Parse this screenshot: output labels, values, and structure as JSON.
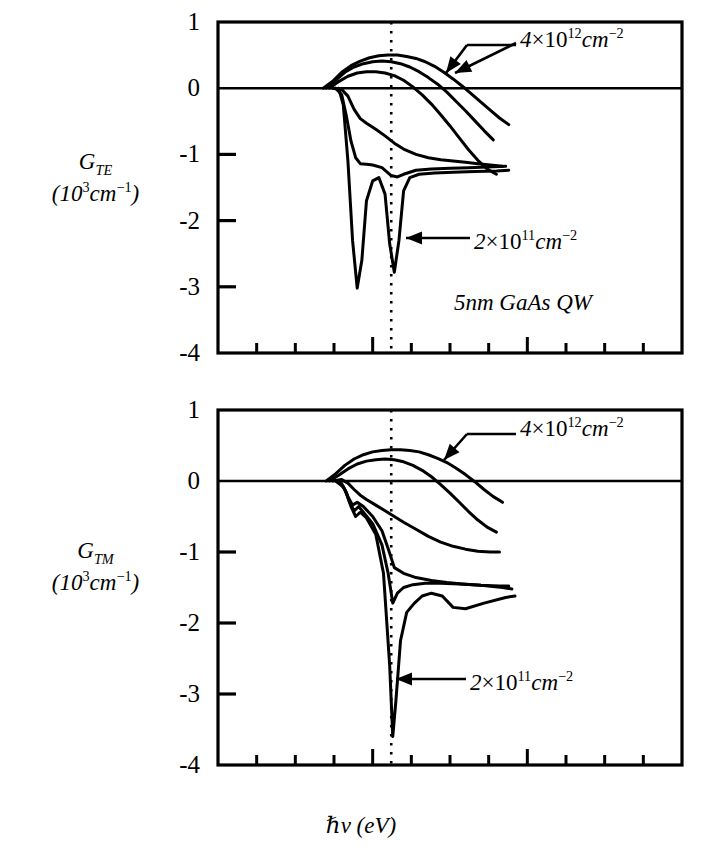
{
  "figure": {
    "xlabel_hbar": "ℏ",
    "xlabel_nu": "ν",
    "xlabel_unit": "(eV)",
    "material_note": "5nm GaAs QW"
  },
  "panels": [
    {
      "id": "TE",
      "ylabel_main": "G",
      "ylabel_sub": "TE",
      "ylabel_units_pre": "(10",
      "ylabel_units_exp": "3",
      "ylabel_units_mid": "cm",
      "ylabel_units_exp2": "−1",
      "ylabel_units_post": ")",
      "yticks": [
        "1",
        "0",
        "-1",
        "-2",
        "-3",
        "-4"
      ],
      "annotation_high": {
        "coef": "4",
        "times": "×",
        "base": "10",
        "exp": "12",
        "unit": "cm",
        "unit_exp": "−2"
      },
      "annotation_low": {
        "coef": "2",
        "times": "×",
        "base": "10",
        "exp": "11",
        "unit": "cm",
        "unit_exp": "−2"
      }
    },
    {
      "id": "TM",
      "ylabel_main": "G",
      "ylabel_sub": "TM",
      "ylabel_units_pre": "(10",
      "ylabel_units_exp": "3",
      "ylabel_units_mid": "cm",
      "ylabel_units_exp2": "−1",
      "ylabel_units_post": ")",
      "yticks": [
        "1",
        "0",
        "-1",
        "-2",
        "-3",
        "-4"
      ],
      "annotation_high": {
        "coef": "4",
        "times": "×",
        "base": "10",
        "exp": "12",
        "unit": "cm",
        "unit_exp": "−2"
      },
      "annotation_low": {
        "coef": "2",
        "times": "×",
        "base": "10",
        "exp": "11",
        "unit": "cm",
        "unit_exp": "−2"
      }
    }
  ],
  "xticks": [
    "1.4",
    "1.5",
    "1.6",
    "1.7"
  ],
  "chart_data": [
    {
      "type": "line",
      "title": "G_TE (10^3 cm^-1) vs photon energy",
      "xlabel": "hbar*nu (eV)",
      "ylabel": "G_TE (10^3 cm^-1)",
      "xlim": [
        1.4,
        1.7
      ],
      "ylim": [
        -4,
        1
      ],
      "xticks": [
        1.4,
        1.5,
        1.6,
        1.7
      ],
      "yticks": [
        1,
        0,
        -1,
        -2,
        -3,
        -4
      ],
      "grid": false,
      "legend": "none",
      "vertical_marker": {
        "x": 1.512,
        "style": "dotted"
      },
      "zero_line": true,
      "annotations": [
        {
          "text": "4×10^12 cm^-2",
          "points_to_curve": "n=4e12",
          "arrow": "down-left",
          "x": 1.575,
          "y": 0.62
        },
        {
          "text": "2×10^11 cm^-2",
          "points_to_curve": "n=2e11",
          "arrow": "left",
          "x": 1.555,
          "y": -2.05
        },
        {
          "text": "5nm GaAs QW",
          "x": 1.555,
          "y": -2.72
        }
      ],
      "series": [
        {
          "name": "n=4e12",
          "x": [
            1.468,
            1.474,
            1.48,
            1.486,
            1.492,
            1.498,
            1.504,
            1.51,
            1.516,
            1.522,
            1.528,
            1.534,
            1.54,
            1.546,
            1.552,
            1.558,
            1.564,
            1.57,
            1.576,
            1.582,
            1.588
          ],
          "values": [
            0.0,
            0.1,
            0.24,
            0.34,
            0.41,
            0.46,
            0.49,
            0.5,
            0.5,
            0.48,
            0.45,
            0.4,
            0.33,
            0.24,
            0.14,
            0.03,
            -0.09,
            -0.21,
            -0.33,
            -0.45,
            -0.55
          ]
        },
        {
          "name": "n=3e12",
          "x": [
            1.47,
            1.476,
            1.482,
            1.488,
            1.494,
            1.5,
            1.506,
            1.512,
            1.518,
            1.524,
            1.53,
            1.536,
            1.542,
            1.548,
            1.554,
            1.56,
            1.566,
            1.572,
            1.578
          ],
          "values": [
            0.0,
            0.12,
            0.24,
            0.32,
            0.37,
            0.4,
            0.41,
            0.4,
            0.37,
            0.32,
            0.25,
            0.16,
            0.06,
            -0.06,
            -0.2,
            -0.34,
            -0.49,
            -0.64,
            -0.78
          ]
        },
        {
          "name": "n=2e12",
          "x": [
            1.472,
            1.478,
            1.484,
            1.49,
            1.496,
            1.502,
            1.508,
            1.514,
            1.52,
            1.526,
            1.532,
            1.538,
            1.544,
            1.55,
            1.556,
            1.562,
            1.568,
            1.574,
            1.58
          ],
          "values": [
            0.0,
            0.1,
            0.18,
            0.23,
            0.25,
            0.25,
            0.23,
            0.19,
            0.12,
            0.02,
            -0.1,
            -0.24,
            -0.4,
            -0.57,
            -0.75,
            -0.93,
            -1.09,
            -1.22,
            -1.3
          ]
        },
        {
          "name": "n=1e12",
          "x": [
            1.474,
            1.48,
            1.484,
            1.488,
            1.492,
            1.496,
            1.502,
            1.508,
            1.514,
            1.52,
            1.528,
            1.536,
            1.544,
            1.552,
            1.56,
            1.568,
            1.576,
            1.584
          ],
          "values": [
            0.0,
            -0.02,
            -0.12,
            -0.32,
            -0.46,
            -0.53,
            -0.62,
            -0.72,
            -0.83,
            -0.92,
            -1.0,
            -1.05,
            -1.08,
            -1.1,
            -1.12,
            -1.14,
            -1.16,
            -1.18
          ]
        },
        {
          "name": "n=5e11",
          "x": [
            1.476,
            1.48,
            1.483,
            1.486,
            1.489,
            1.492,
            1.496,
            1.5,
            1.506,
            1.512,
            1.516,
            1.52,
            1.528,
            1.538,
            1.55,
            1.562,
            1.574,
            1.586
          ],
          "values": [
            0.0,
            -0.1,
            -0.42,
            -0.8,
            -1.05,
            -1.14,
            -1.15,
            -1.16,
            -1.2,
            -1.32,
            -1.34,
            -1.3,
            -1.24,
            -1.22,
            -1.21,
            -1.2,
            -1.19,
            -1.18
          ]
        },
        {
          "name": "n=2e11",
          "x": [
            1.478,
            1.481,
            1.484,
            1.487,
            1.49,
            1.493,
            1.496,
            1.5,
            1.504,
            1.508,
            1.511,
            1.514,
            1.517,
            1.52,
            1.524,
            1.53,
            1.54,
            1.552,
            1.566,
            1.58,
            1.588
          ],
          "values": [
            0.0,
            -0.25,
            -1.1,
            -2.3,
            -3.02,
            -2.6,
            -1.7,
            -1.4,
            -1.35,
            -1.6,
            -2.35,
            -2.78,
            -2.3,
            -1.55,
            -1.35,
            -1.3,
            -1.28,
            -1.27,
            -1.26,
            -1.25,
            -1.24
          ]
        }
      ]
    },
    {
      "type": "line",
      "title": "G_TM (10^3 cm^-1) vs photon energy",
      "xlabel": "hbar*nu (eV)",
      "ylabel": "G_TM (10^3 cm^-1)",
      "xlim": [
        1.4,
        1.7
      ],
      "ylim": [
        -4,
        1
      ],
      "xticks": [
        1.4,
        1.5,
        1.6,
        1.7
      ],
      "yticks": [
        1,
        0,
        -1,
        -2,
        -3,
        -4
      ],
      "grid": false,
      "legend": "none",
      "vertical_marker": {
        "x": 1.512,
        "style": "dotted"
      },
      "zero_line": true,
      "annotations": [
        {
          "text": "4×10^12 cm^-2",
          "points_to_curve": "n=4e12",
          "arrow": "down-left",
          "x": 1.575,
          "y": 0.62
        },
        {
          "text": "2×10^11 cm^-2",
          "points_to_curve": "n=2e11",
          "arrow": "left",
          "x": 1.548,
          "y": -2.8
        }
      ],
      "series": [
        {
          "name": "n=4e12",
          "x": [
            1.47,
            1.476,
            1.482,
            1.488,
            1.494,
            1.5,
            1.506,
            1.512,
            1.518,
            1.524,
            1.53,
            1.536,
            1.542,
            1.548,
            1.554,
            1.56,
            1.566,
            1.572,
            1.578,
            1.584
          ],
          "values": [
            0.0,
            0.1,
            0.22,
            0.31,
            0.37,
            0.41,
            0.43,
            0.44,
            0.44,
            0.43,
            0.41,
            0.37,
            0.32,
            0.26,
            0.18,
            0.09,
            -0.01,
            -0.12,
            -0.22,
            -0.3
          ]
        },
        {
          "name": "n=3e12",
          "x": [
            1.472,
            1.478,
            1.484,
            1.49,
            1.496,
            1.502,
            1.508,
            1.514,
            1.52,
            1.526,
            1.532,
            1.538,
            1.544,
            1.55,
            1.556,
            1.562,
            1.568,
            1.574,
            1.58
          ],
          "values": [
            0.0,
            0.08,
            0.17,
            0.24,
            0.28,
            0.3,
            0.31,
            0.3,
            0.27,
            0.22,
            0.15,
            0.06,
            -0.05,
            -0.17,
            -0.3,
            -0.43,
            -0.55,
            -0.65,
            -0.72
          ]
        },
        {
          "name": "n=2e12",
          "x": [
            1.474,
            1.48,
            1.484,
            1.488,
            1.492,
            1.496,
            1.502,
            1.508,
            1.514,
            1.52,
            1.528,
            1.536,
            1.544,
            1.552,
            1.56,
            1.568,
            1.576,
            1.582
          ],
          "values": [
            0.0,
            0.02,
            -0.03,
            -0.12,
            -0.2,
            -0.26,
            -0.34,
            -0.42,
            -0.5,
            -0.58,
            -0.68,
            -0.78,
            -0.86,
            -0.92,
            -0.96,
            -0.99,
            -1.0,
            -1.0
          ]
        },
        {
          "name": "n=1e12",
          "x": [
            1.476,
            1.481,
            1.484,
            1.487,
            1.49,
            1.494,
            1.5,
            1.506,
            1.51,
            1.514,
            1.52,
            1.528,
            1.538,
            1.548,
            1.558,
            1.57,
            1.582,
            1.588
          ],
          "values": [
            0.0,
            -0.08,
            -0.22,
            -0.34,
            -0.3,
            -0.36,
            -0.5,
            -0.7,
            -0.95,
            -1.22,
            -1.3,
            -1.36,
            -1.4,
            -1.43,
            -1.45,
            -1.47,
            -1.48,
            -1.48
          ]
        },
        {
          "name": "n=5e11",
          "x": [
            1.478,
            1.482,
            1.485,
            1.488,
            1.491,
            1.494,
            1.5,
            1.506,
            1.51,
            1.513,
            1.516,
            1.52,
            1.526,
            1.534,
            1.544,
            1.556,
            1.57,
            1.584,
            1.59
          ],
          "values": [
            0.0,
            -0.12,
            -0.3,
            -0.42,
            -0.36,
            -0.44,
            -0.6,
            -0.9,
            -1.3,
            -1.72,
            -1.58,
            -1.5,
            -1.46,
            -1.44,
            -1.44,
            -1.45,
            -1.47,
            -1.5,
            -1.52
          ]
        },
        {
          "name": "n=2e11",
          "x": [
            1.479,
            1.483,
            1.486,
            1.489,
            1.492,
            1.496,
            1.502,
            1.507,
            1.511,
            1.513,
            1.515,
            1.518,
            1.522,
            1.527,
            1.532,
            1.538,
            1.545,
            1.552,
            1.56,
            1.572,
            1.586,
            1.592
          ],
          "values": [
            0.0,
            -0.16,
            -0.36,
            -0.5,
            -0.44,
            -0.52,
            -0.75,
            -1.3,
            -2.6,
            -3.6,
            -3.1,
            -2.25,
            -1.85,
            -1.72,
            -1.62,
            -1.58,
            -1.62,
            -1.78,
            -1.8,
            -1.72,
            -1.64,
            -1.62
          ]
        }
      ]
    }
  ]
}
